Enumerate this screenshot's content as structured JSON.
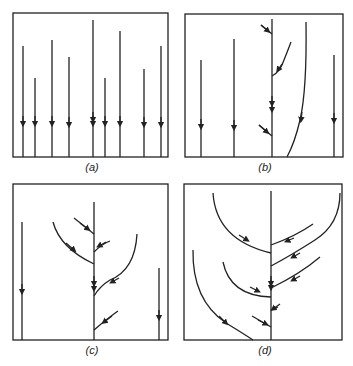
{
  "figure": {
    "panels": [
      {
        "id": "a",
        "label": "(a)"
      },
      {
        "id": "b",
        "label": "(b)"
      },
      {
        "id": "c",
        "label": "(c)"
      },
      {
        "id": "d",
        "label": "(d)"
      }
    ],
    "colors": {
      "stroke": "#222222",
      "background": "#ffffff"
    }
  }
}
